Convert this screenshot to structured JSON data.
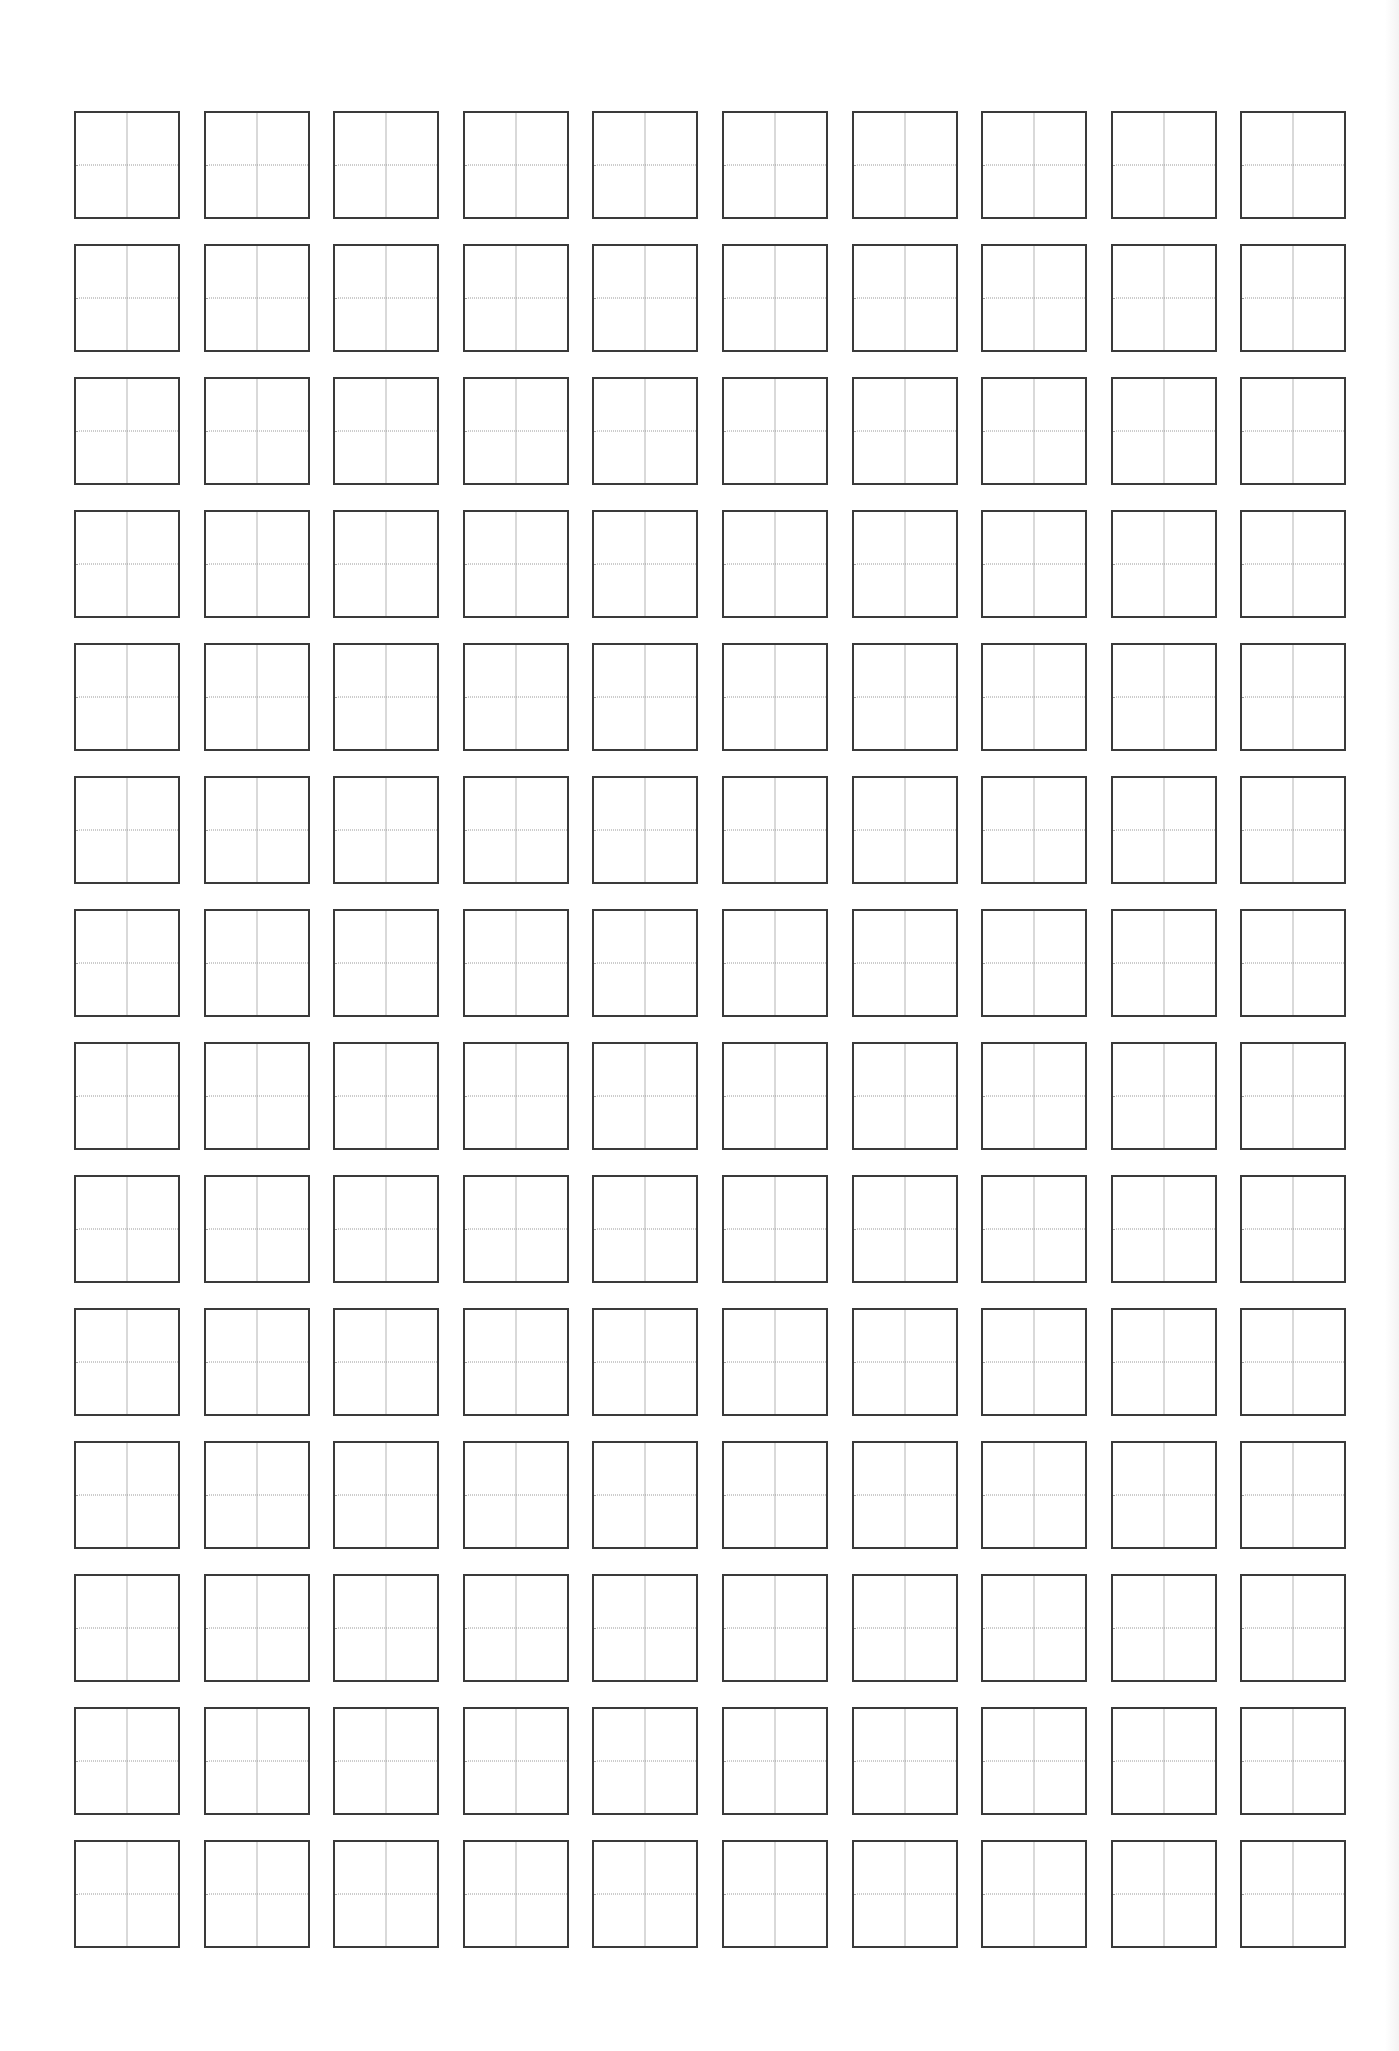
{
  "document": {
    "type": "tianzige-practice-sheet",
    "rows": 14,
    "columns": 10,
    "cells_filled": 0
  },
  "layout": {
    "origin_x": 74,
    "origin_y": 111,
    "cell_width": 106,
    "cell_height": 108,
    "column_pitch": 129.6,
    "row_pitch": 133
  },
  "colors": {
    "background": "#ffffff",
    "cell_border": "#3a3a3a",
    "vertical_guide": "#b4b4b4",
    "horizontal_guide": "#9a9a9a"
  },
  "guides": {
    "vertical": "solid",
    "horizontal": "dotted"
  }
}
